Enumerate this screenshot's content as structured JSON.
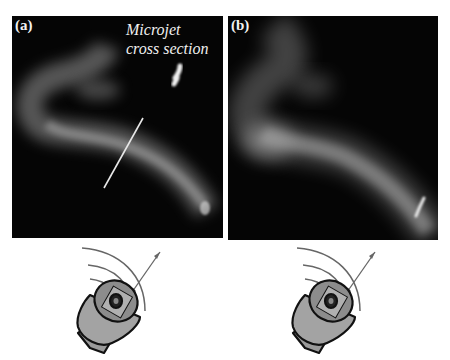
{
  "figure": {
    "panels": [
      {
        "label": "(a)",
        "annotation_line1": "Microjet",
        "annotation_line2": "cross section",
        "description": "Smoke visualization of curved microjet with cross-section line"
      },
      {
        "label": "(b)",
        "description": "Smoke visualization of microjet bending upward"
      }
    ],
    "speakers": [
      {
        "name": "loudspeaker-a",
        "icon": "speaker-icon"
      },
      {
        "name": "loudspeaker-b",
        "icon": "speaker-icon"
      }
    ]
  }
}
